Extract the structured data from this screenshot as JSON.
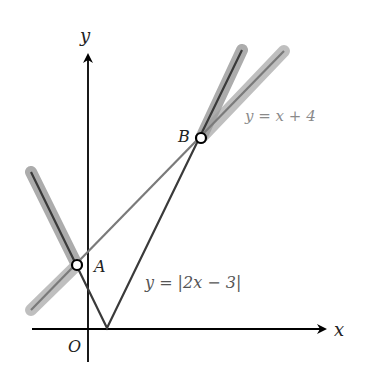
{
  "diagram": {
    "type": "coordinate-graph",
    "axes": {
      "x_label": "x",
      "y_label": "y",
      "origin_label": "O"
    },
    "curves": [
      {
        "id": "abs",
        "equation_label": "y = |2x − 3|",
        "color": "#3a3a3a"
      },
      {
        "id": "linear",
        "equation_label": "y = x + 4",
        "color": "#7a7a7a"
      }
    ],
    "points": [
      {
        "label": "A"
      },
      {
        "label": "B"
      }
    ],
    "highlight_color": "#9a9a9a",
    "axis_color": "#000000"
  }
}
